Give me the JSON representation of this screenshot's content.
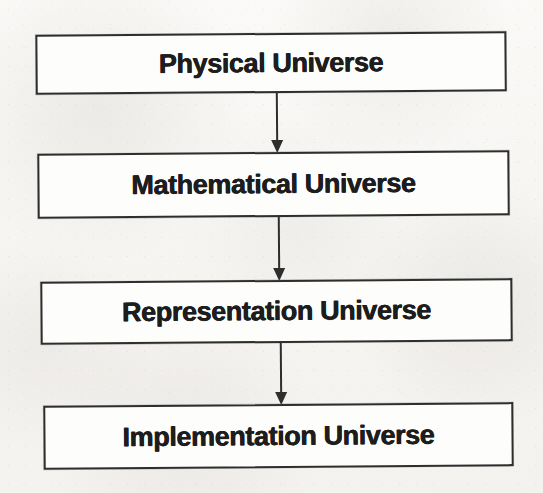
{
  "diagram": {
    "orientation": "vertical-top-down",
    "background_color": "#f8f7f5",
    "stroke_color": "#2e2e2e",
    "text_color": "#1d1d1d",
    "nodes": [
      {
        "id": "physical",
        "label": "Physical Universe"
      },
      {
        "id": "mathematical",
        "label": "Mathematical Universe"
      },
      {
        "id": "representation",
        "label": "Representation Universe"
      },
      {
        "id": "implementation",
        "label": "Implementation Universe"
      }
    ],
    "connectors": [
      {
        "id": "arrow-1",
        "from": "physical",
        "to": "mathematical",
        "kind": "down-arrow"
      },
      {
        "id": "arrow-2",
        "from": "mathematical",
        "to": "representation",
        "kind": "down-arrow"
      },
      {
        "id": "arrow-3",
        "from": "representation",
        "to": "implementation",
        "kind": "down-arrow"
      }
    ]
  }
}
